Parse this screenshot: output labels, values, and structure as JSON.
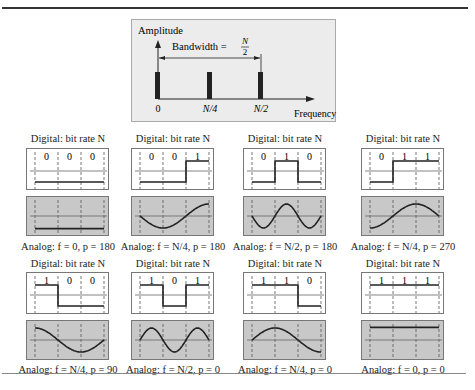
{
  "caption_fragment": "Figure 3.xx  Bandwidth requirement: worst case and best case in digital transmission",
  "spectrum": {
    "y_axis_label": "Amplitude",
    "x_axis_label": "Frequency",
    "bandwidth_label": "Bandwidth = ",
    "bandwidth_numerator": "N",
    "bandwidth_denominator": "2",
    "ticks": [
      "0",
      "N/4",
      "N/2"
    ]
  },
  "colors": {
    "spectrum_bg": "#ececec",
    "analog_bg": "#c8c8c8",
    "line": "#222222"
  },
  "cases": [
    {
      "digital_label": "Digital: bit rate N",
      "bits": [
        "0",
        "0",
        "0"
      ],
      "analog_label": "Analog: f = 0, p = 180",
      "f": "0",
      "p": 180
    },
    {
      "digital_label": "Digital: bit rate N",
      "bits": [
        "0",
        "0",
        "1"
      ],
      "analog_label": "Analog: f = N/4, p = 180",
      "f": "N/4",
      "p": 180
    },
    {
      "digital_label": "Digital: bit rate N",
      "bits": [
        "0",
        "1",
        "0"
      ],
      "analog_label": "Analog: f = N/2, p = 180",
      "f": "N/2",
      "p": 180
    },
    {
      "digital_label": "Digital: bit rate N",
      "bits": [
        "0",
        "1",
        "1"
      ],
      "analog_label": "Analog: f = N/4, p = 270",
      "f": "N/4",
      "p": 270
    },
    {
      "digital_label": "Digital: bit rate N",
      "bits": [
        "1",
        "0",
        "0"
      ],
      "analog_label": "Analog: f = N/4, p = 90",
      "f": "N/4",
      "p": 90
    },
    {
      "digital_label": "Digital: bit rate N",
      "bits": [
        "1",
        "0",
        "1"
      ],
      "analog_label": "Analog: f = N/2, p = 0",
      "f": "N/2",
      "p": 0
    },
    {
      "digital_label": "Digital: bit rate N",
      "bits": [
        "1",
        "1",
        "0"
      ],
      "analog_label": "Analog: f = N/4, p = 0",
      "f": "N/4",
      "p": 0
    },
    {
      "digital_label": "Digital: bit rate N",
      "bits": [
        "1",
        "1",
        "1"
      ],
      "analog_label": "Analog: f = 0, p = 0",
      "f": "0",
      "p": 0
    }
  ]
}
